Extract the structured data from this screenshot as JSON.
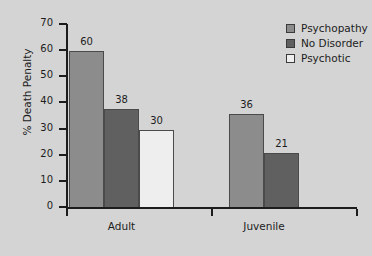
{
  "chart_data": {
    "type": "bar",
    "title": "",
    "xlabel": "",
    "ylabel": "% Death Penalty",
    "categories": [
      "Adult",
      "Juvenile"
    ],
    "ylim": [
      0,
      70
    ],
    "yticks": [
      0,
      10,
      20,
      30,
      40,
      50,
      60,
      70
    ],
    "ytick_labels": [
      "0",
      "10",
      "20",
      "30",
      "40",
      "50",
      "60",
      "70"
    ],
    "grid": false,
    "legend_position": "top-right",
    "series": [
      {
        "name": "Psychopathy",
        "color": "#8c8c8c",
        "values": [
          60,
          36
        ],
        "labels": [
          "60",
          "36"
        ]
      },
      {
        "name": "No Disorder",
        "color": "#606060",
        "values": [
          38,
          21
        ],
        "labels": [
          "38",
          "21"
        ]
      },
      {
        "name": "Psychotic",
        "color": "#eeeeee",
        "values": [
          30,
          null
        ],
        "labels": [
          "30",
          ""
        ]
      }
    ],
    "background_color": "#d4d4d4",
    "axis_color": "#1c1c1c"
  }
}
